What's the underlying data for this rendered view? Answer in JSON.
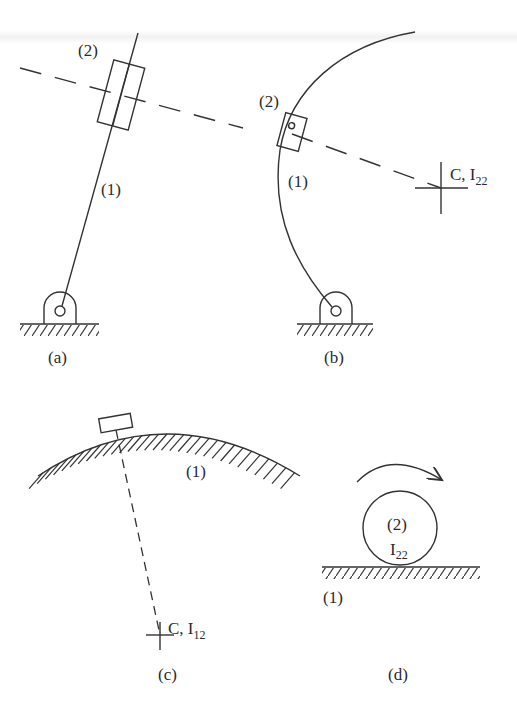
{
  "figure": {
    "panels": [
      {
        "id": "a",
        "caption": "(a)",
        "link_label": "(1)",
        "slider_label": "(2)",
        "description": "Straight link (1) pinned to ground with slider (2) on it; dashed line through slider perpendicular to link"
      },
      {
        "id": "b",
        "caption": "(b)",
        "link_label": "(1)",
        "slider_label": "(2)",
        "center_label": "C, I",
        "center_sub": "22",
        "description": "Curved link (1) pinned to ground with slider (2); dashed radius to center of curvature C"
      },
      {
        "id": "c",
        "caption": "(c)",
        "surface_label": "(1)",
        "center_label": "C, I",
        "center_sub": "12",
        "description": "Block sliding on curved fixed surface (1); dashed radius to center of curvature C"
      },
      {
        "id": "d",
        "caption": "(d)",
        "ground_label": "(1)",
        "wheel_label": "(2)",
        "wheel_center_label": "I",
        "wheel_center_sub": "22",
        "description": "Wheel (2) rolling on flat ground (1) with clockwise rotation arrow"
      }
    ],
    "colors": {
      "ink": "#333333",
      "background": "#ffffff"
    }
  }
}
